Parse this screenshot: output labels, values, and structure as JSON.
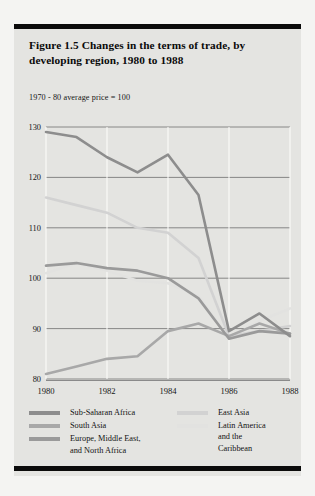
{
  "figure": {
    "title": "Figure 1.5  Changes in the terms of trade,\nby developing region, 1980 to 1988",
    "subtitle": "1970 - 80 average price = 100"
  },
  "legend": {
    "left": [
      {
        "label": "Sub-Saharan Africa",
        "color": "#8d8d8d"
      },
      {
        "label": "South Asia",
        "color": "#a8a8a8"
      },
      {
        "label": "Europe, Middle East,\nand North Africa",
        "color": "#9a9a9a"
      }
    ],
    "right": [
      {
        "label": "East Asia",
        "color": "#d2d2d2"
      },
      {
        "label": "Latin America\nand the\nCaribbean",
        "color": "#e2e2e0"
      }
    ]
  },
  "chart_data": {
    "type": "line",
    "title": "Figure 1.5  Changes in the terms of trade, by developing region, 1980 to 1988",
    "subtitle": "1970 - 80 average price = 100",
    "xlabel": "",
    "ylabel": "",
    "x": [
      1980,
      1981,
      1982,
      1983,
      1984,
      1985,
      1986,
      1987,
      1988
    ],
    "xticks": [
      1980,
      1982,
      1984,
      1986,
      1988
    ],
    "yticks": [
      80,
      90,
      100,
      110,
      120,
      130
    ],
    "xlim": [
      1980,
      1988
    ],
    "ylim": [
      76,
      130
    ],
    "grid": true,
    "legend_position": "below-axes",
    "series": [
      {
        "name": "Sub-Saharan Africa",
        "color": "#8d8d8d",
        "values": [
          129.0,
          128.0,
          124.0,
          121.0,
          124.5,
          116.5,
          89.5,
          93.0,
          88.5
        ]
      },
      {
        "name": "South Asia",
        "color": "#a8a8a8",
        "values": [
          81.0,
          82.5,
          84.0,
          84.5,
          89.5,
          91.0,
          88.5,
          91.0,
          89.0
        ]
      },
      {
        "name": "Europe, Middle East, and North Africa",
        "color": "#9a9a9a",
        "values": [
          102.5,
          103.0,
          102.0,
          101.5,
          100.0,
          96.0,
          88.0,
          89.5,
          89.0
        ]
      },
      {
        "name": "East Asia",
        "color": "#d2d2d2",
        "values": [
          116.0,
          114.5,
          113.0,
          110.0,
          109.0,
          104.0,
          88.5,
          89.5,
          90.5
        ]
      },
      {
        "name": "Latin America and the Caribbean",
        "color": "#e2e2e0",
        "values": [
          101.0,
          103.0,
          101.5,
          99.5,
          99.0,
          96.5,
          88.0,
          91.5,
          94.0
        ]
      }
    ]
  }
}
